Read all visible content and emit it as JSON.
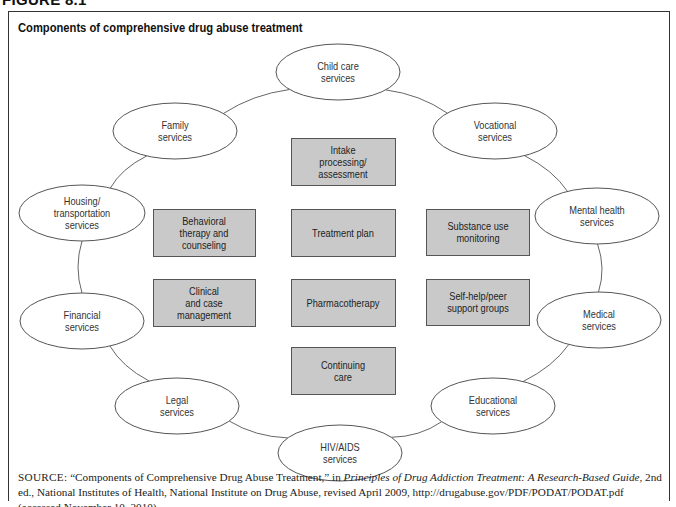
{
  "figure_label": "FIGURE 8.1",
  "title": "Components of comprehensive drug abuse treatment",
  "colors": {
    "box_fill": "#c9c9c9",
    "box_stroke": "#555555",
    "ellipse_stroke": "#555555",
    "connector": "#666666"
  },
  "core_components": [
    {
      "id": "intake",
      "lines": [
        "Intake",
        "processing/",
        "assessment"
      ],
      "x": 291,
      "y": 138,
      "w": 104,
      "h": 47
    },
    {
      "id": "behavioral",
      "lines": [
        "Behavioral",
        "therapy and",
        "counseling"
      ],
      "x": 153,
      "y": 209,
      "w": 102,
      "h": 47
    },
    {
      "id": "treatment-plan",
      "lines": [
        "Treatment plan"
      ],
      "x": 291,
      "y": 209,
      "w": 104,
      "h": 47
    },
    {
      "id": "substance-use",
      "lines": [
        "Substance use",
        "monitoring"
      ],
      "x": 426,
      "y": 209,
      "w": 103,
      "h": 46
    },
    {
      "id": "clinical",
      "lines": [
        "Clinical",
        "and case",
        "management"
      ],
      "x": 153,
      "y": 279,
      "w": 102,
      "h": 47
    },
    {
      "id": "pharmacotherapy",
      "lines": [
        "Pharmacotherapy"
      ],
      "x": 291,
      "y": 279,
      "w": 104,
      "h": 47
    },
    {
      "id": "self-help",
      "lines": [
        "Self-help/peer",
        "support groups"
      ],
      "x": 426,
      "y": 279,
      "w": 103,
      "h": 46
    },
    {
      "id": "continuing-care",
      "lines": [
        "Continuing",
        "care"
      ],
      "x": 291,
      "y": 347,
      "w": 104,
      "h": 47
    }
  ],
  "services": [
    {
      "id": "child-care",
      "lines": [
        "Child care",
        "services"
      ],
      "cx": 338,
      "cy": 72,
      "rx": 62,
      "ry": 28
    },
    {
      "id": "vocational",
      "lines": [
        "Vocational",
        "services"
      ],
      "cx": 495,
      "cy": 131,
      "rx": 62,
      "ry": 28
    },
    {
      "id": "mental-health",
      "lines": [
        "Mental health",
        "services"
      ],
      "cx": 597,
      "cy": 216,
      "rx": 62,
      "ry": 28
    },
    {
      "id": "medical",
      "lines": [
        "Medical",
        "services"
      ],
      "cx": 599,
      "cy": 320,
      "rx": 62,
      "ry": 28
    },
    {
      "id": "educational",
      "lines": [
        "Educational",
        "services"
      ],
      "cx": 493,
      "cy": 406,
      "rx": 62,
      "ry": 28
    },
    {
      "id": "hiv-aids",
      "lines": [
        "HIV/AIDS",
        "services"
      ],
      "cx": 340,
      "cy": 453,
      "rx": 62,
      "ry": 28
    },
    {
      "id": "legal",
      "lines": [
        "Legal",
        "services"
      ],
      "cx": 177,
      "cy": 406,
      "rx": 62,
      "ry": 28
    },
    {
      "id": "financial",
      "lines": [
        "Financial",
        "services"
      ],
      "cx": 82,
      "cy": 321,
      "rx": 62,
      "ry": 28
    },
    {
      "id": "housing",
      "lines": [
        "Housing/",
        "transportation",
        "services"
      ],
      "cx": 82,
      "cy": 213,
      "rx": 63,
      "ry": 28
    },
    {
      "id": "family",
      "lines": [
        "Family",
        "services"
      ],
      "cx": 175,
      "cy": 131,
      "rx": 62,
      "ry": 28
    }
  ],
  "source": {
    "label": "SOURCE:",
    "text_before_italic": " “Components of Comprehensive Drug Abuse Treatment,” in ",
    "italic": "Principles of Drug Addiction Treatment: A Research-Based Guide",
    "text_after_italic": ", 2nd ed., National Institutes of Health, National Institute on Drug Abuse, revised April 2009, http://drugabuse.gov/PDF/PODAT/PODAT.pdf (accessed November 10, 2010)"
  }
}
